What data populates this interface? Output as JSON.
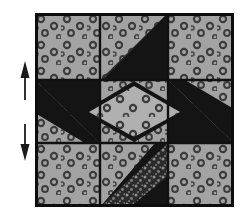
{
  "figure": {
    "kind": "quilt-block-diagram",
    "canvas": {
      "width": 244,
      "height": 223,
      "background": "#ffffff"
    }
  },
  "colors": {
    "background_fabric": "#a3a3a3",
    "background_motif": "#3a3a3a",
    "dark_solid_fabric": "#141414",
    "dark_print_fabric": "#2e2e2e",
    "dark_print_speckle": "#8f8f8f",
    "center_fabric": "#b0b0b0",
    "seam_line": "#111111",
    "outer_border": "#0d0d0d",
    "arrow": "#1a1a1a",
    "page": "#ffffff"
  },
  "block": {
    "label": "quilt-block",
    "origin": {
      "x": 35,
      "y": 13
    },
    "size": {
      "width": 199,
      "height": 194
    },
    "grid": {
      "columns": 3,
      "rows": 3,
      "x_divisions": [
        0,
        65,
        133,
        199
      ],
      "y_divisions": [
        0,
        67,
        130,
        194
      ]
    },
    "cells": [
      {
        "name": "cell-top-left",
        "row": 0,
        "col": 0,
        "fabric": "background_fabric",
        "shape": "square"
      },
      {
        "name": "cell-top-center",
        "row": 0,
        "col": 1,
        "fabric": "background_fabric",
        "shape": "half-square-triangle-with-print"
      },
      {
        "name": "cell-top-right",
        "row": 0,
        "col": 2,
        "fabric": "background_fabric",
        "shape": "square"
      },
      {
        "name": "cell-middle-left",
        "row": 1,
        "col": 0,
        "fabric": "background_fabric",
        "shape": "diagonal-black-bar"
      },
      {
        "name": "cell-center",
        "row": 1,
        "col": 1,
        "fabric": "center_fabric",
        "shape": "square-on-point"
      },
      {
        "name": "cell-middle-right",
        "row": 1,
        "col": 2,
        "fabric": "background_fabric",
        "shape": "diagonal-black-bar"
      },
      {
        "name": "cell-bottom-left",
        "row": 2,
        "col": 0,
        "fabric": "background_fabric",
        "shape": "square"
      },
      {
        "name": "cell-bottom-center",
        "row": 2,
        "col": 1,
        "fabric": "background_fabric",
        "shape": "half-square-triangle-with-print"
      },
      {
        "name": "cell-bottom-right",
        "row": 2,
        "col": 2,
        "fabric": "background_fabric",
        "shape": "square"
      }
    ]
  },
  "arrows": [
    {
      "name": "arrow-up",
      "direction": "up",
      "x": 25,
      "y_tip": 62,
      "y_tail": 100,
      "label": ""
    },
    {
      "name": "arrow-down",
      "direction": "down",
      "x": 25,
      "y_tip": 160,
      "y_tail": 124,
      "label": ""
    }
  ]
}
